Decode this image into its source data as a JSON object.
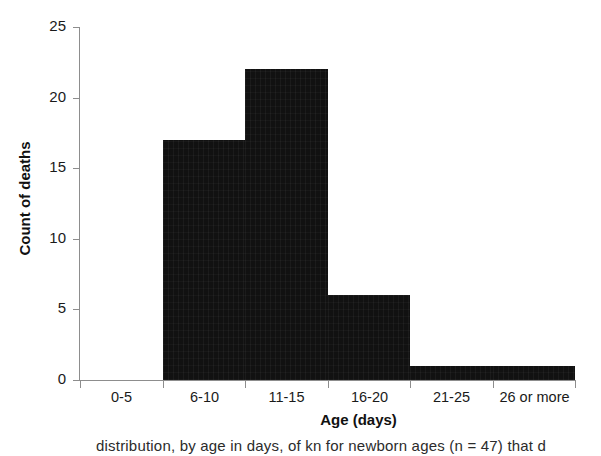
{
  "chart_data": {
    "type": "bar",
    "title": "",
    "subtitle": "",
    "xlabel": "Age (days)",
    "ylabel": "Count of deaths",
    "categories": [
      "0-5",
      "6-10",
      "11-15",
      "16-20",
      "21-25",
      "26 or more"
    ],
    "values": [
      0,
      17,
      22,
      6,
      1,
      1
    ],
    "ylim": [
      0,
      25
    ],
    "yticks": [
      0,
      5,
      10,
      15,
      20,
      25
    ],
    "grid": false,
    "legend": "none",
    "bar_color": "#111111",
    "axis_color": "#8d8d8d",
    "note": "histogram, adjacent bars with no gaps"
  },
  "axes": {
    "y_title": "Count of deaths",
    "x_title": "Age (days)",
    "y_tick_labels": [
      "0",
      "5",
      "10",
      "15",
      "20",
      "25"
    ],
    "x_tick_labels": [
      "0-5",
      "6-10",
      "11-15",
      "16-20",
      "21-25",
      "26 or more"
    ]
  },
  "caption": {
    "text": "distribution, by age in days, of kn for newborn ages (n = 47) that d"
  }
}
